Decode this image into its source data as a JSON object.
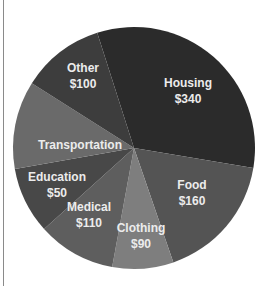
{
  "chart_data": {
    "type": "pie",
    "title": "",
    "center": [
      134,
      148
    ],
    "radius": 121,
    "slices": [
      {
        "label": "Housing",
        "value": 340,
        "value_label": "$340",
        "start_deg": -17.7,
        "end_deg": 99.5,
        "color": "#2b2b2b",
        "label_pos": [
          188,
          90
        ]
      },
      {
        "label": "Food",
        "value": 160,
        "value_label": "$160",
        "start_deg": 99.5,
        "end_deg": 161.0,
        "color": "#545454",
        "label_pos": [
          192,
          192
        ]
      },
      {
        "label": "Clothing",
        "value": 90,
        "value_label": "$90",
        "start_deg": 161.0,
        "end_deg": 190.4,
        "color": "#7e7e7e",
        "label_pos": [
          141,
          235
        ]
      },
      {
        "label": "Medical",
        "value": 110,
        "value_label": "$110",
        "start_deg": 190.4,
        "end_deg": 228.0,
        "color": "#5e5e5e",
        "label_pos": [
          89,
          214
        ]
      },
      {
        "label": "Education",
        "value": 50,
        "value_label": "$50",
        "start_deg": 228.0,
        "end_deg": 260.0,
        "color": "#484848",
        "label_pos": [
          57,
          184
        ]
      },
      {
        "label": "Transportation",
        "value": null,
        "value_label": "",
        "start_deg": 260.0,
        "end_deg": 302.4,
        "color": "#6a6a6a",
        "label_pos": [
          80,
          145
        ]
      },
      {
        "label": "Other",
        "value": 100,
        "value_label": "$100",
        "start_deg": 302.4,
        "end_deg": 342.3,
        "color": "#3d3d3d",
        "label_pos": [
          83,
          75
        ]
      }
    ],
    "legend": "none"
  }
}
